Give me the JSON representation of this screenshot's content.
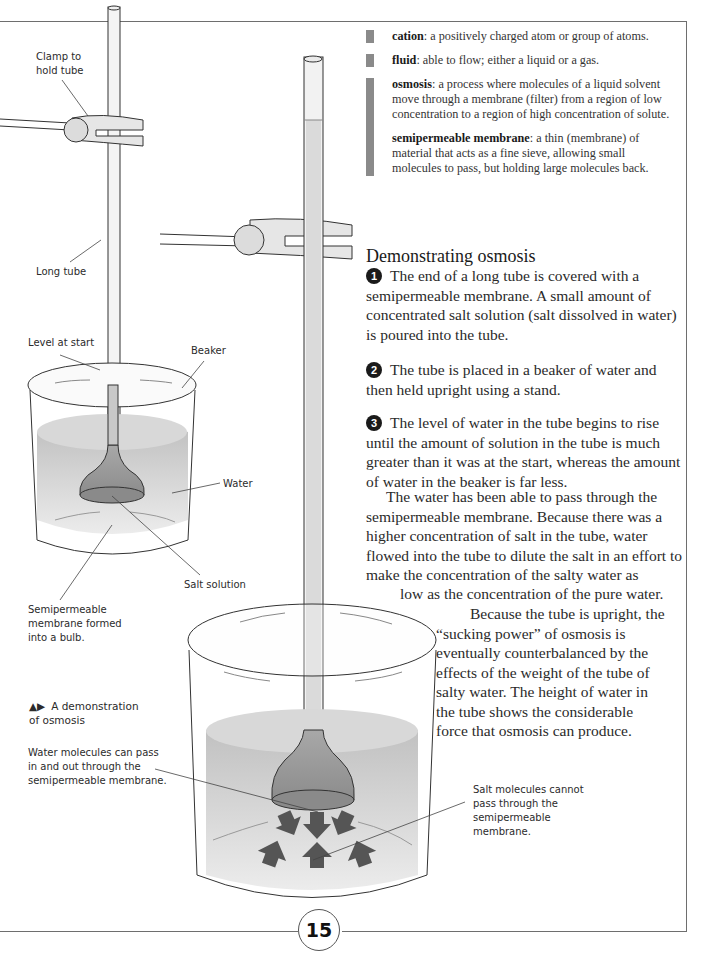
{
  "glossary": [
    {
      "term": "cation",
      "definition": ": a positively charged atom or group of atoms."
    },
    {
      "term": "fluid",
      "definition": ": able to flow; either a liquid or a gas."
    },
    {
      "term": "osmosis",
      "definition": ": a process where molecules of a liquid solvent move through a membrane (filter) from a region of low concentration to a region of high concentration of solute."
    },
    {
      "term": "semipermeable membrane",
      "definition": ": a thin (membrane) of material that acts as a fine sieve, allowing small molecules to pass, but holding large molecules back."
    }
  ],
  "section": {
    "heading": "Demonstrating osmosis",
    "steps": [
      {
        "number": "1",
        "text": "The end of a long tube is covered with a semipermeable membrane. A small amount of concentrated salt solution (salt dissolved in water) is poured into the tube."
      },
      {
        "number": "2",
        "text": "The tube is placed in a beaker of water and then held upright using a stand."
      },
      {
        "number": "3",
        "text": "The level of water in the tube begins to rise until the amount of solution in the tube is much greater than it was at the start, whereas the amount of water in the beaker is far less."
      }
    ],
    "paragraph1": "The water has been able to pass through the semipermeable membrane. Because there was a higher concentration of salt in the tube, water flowed into the tube to dilute the salt in an effort to make the concentration of the salty water as",
    "paragraph1_end": "low as the concentration of the pure water.",
    "paragraph2": [
      "Because the tube is upright, the",
      "“sucking power” of osmosis is",
      "eventually counterbalanced by the",
      "effects of the weight of the tube of",
      "salty water. The height of water in",
      "the tube shows the considerable",
      "force that osmosis can produce."
    ]
  },
  "labels": {
    "clamp": [
      "Clamp to",
      "hold tube"
    ],
    "long_tube": "Long tube",
    "level_at_start": "Level at start",
    "beaker": "Beaker",
    "water": "Water",
    "salt_solution": "Salt solution",
    "membrane": [
      "Semipermeable",
      "membrane formed",
      "into a bulb."
    ],
    "water_molecules": [
      "Water molecules can pass",
      "in and out through the",
      "semipermeable membrane."
    ],
    "salt_molecules": [
      "Salt molecules cannot",
      "pass through the",
      "semipermeable",
      "membrane."
    ]
  },
  "caption": {
    "icon": "▲▶",
    "line1": "A demonstration",
    "line2": "of osmosis"
  },
  "page_number": "15"
}
